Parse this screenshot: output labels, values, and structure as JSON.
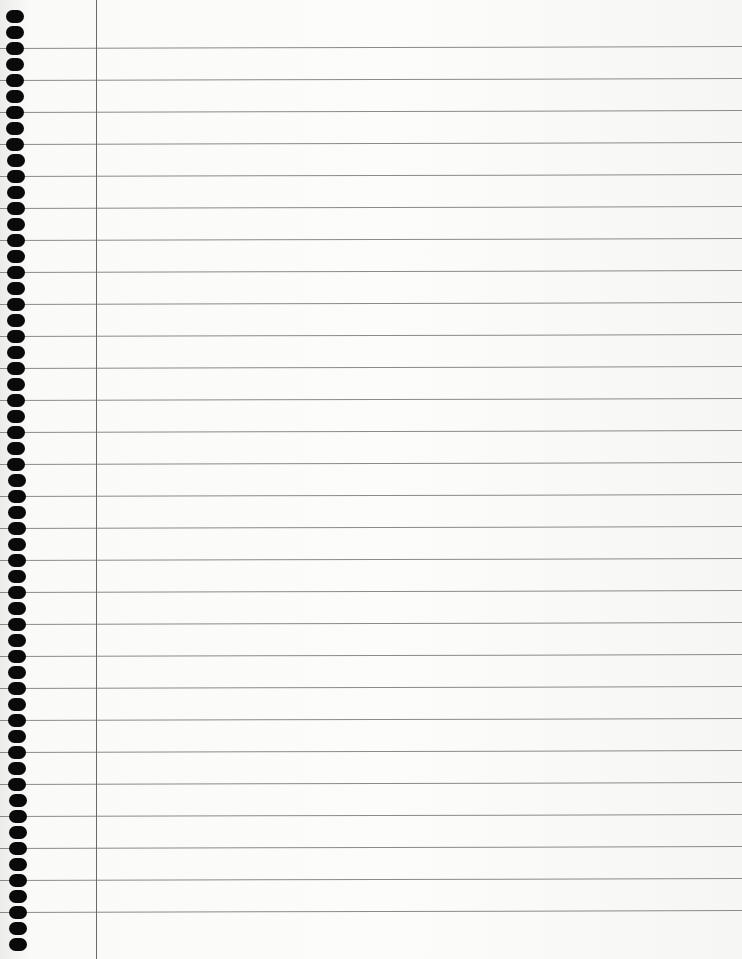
{
  "paper": {
    "type": "lined notebook paper",
    "colors": {
      "paper": "#fafaf9",
      "rule_line": "#8a8a8a",
      "margin_line": "#6a6a6a",
      "hole": "#0a0a0a"
    },
    "rule_start_y": 47,
    "rule_spacing": 32,
    "rule_count": 28,
    "margin_x": 96,
    "hole_start_y": 2,
    "hole_spacing": 32,
    "hole_count": 60
  }
}
